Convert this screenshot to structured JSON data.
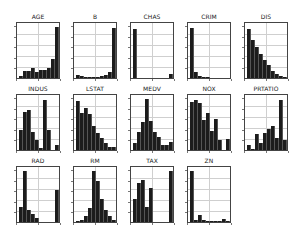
{
  "figure": {
    "title": "",
    "layout": "3 rows x 5 columns of histograms"
  },
  "chart_data": [
    {
      "type": "bar",
      "title": "AGE",
      "bins": 10,
      "values": [
        4,
        14,
        14,
        19,
        12,
        15,
        16,
        18,
        35,
        96
      ],
      "ylim": [
        0,
        100
      ]
    },
    {
      "type": "bar",
      "title": "B",
      "bins": 10,
      "values": [
        5,
        3,
        2,
        1,
        1,
        2,
        3,
        5,
        12,
        95
      ],
      "ylim": [
        0,
        100
      ]
    },
    {
      "type": "bar",
      "title": "CHAS",
      "bins": 10,
      "values": [
        93,
        0,
        0,
        0,
        0,
        0,
        0,
        0,
        0,
        7
      ],
      "ylim": [
        0,
        100
      ]
    },
    {
      "type": "bar",
      "title": "CRIM",
      "bins": 10,
      "values": [
        95,
        12,
        4,
        1,
        1,
        0,
        0,
        0,
        0,
        0
      ],
      "ylim": [
        0,
        100
      ]
    },
    {
      "type": "bar",
      "title": "DIS",
      "bins": 10,
      "values": [
        92,
        72,
        58,
        45,
        34,
        25,
        14,
        8,
        4,
        1
      ],
      "ylim": [
        0,
        100
      ]
    },
    {
      "type": "bar",
      "title": "INDUS",
      "bins": 10,
      "values": [
        38,
        72,
        76,
        34,
        18,
        4,
        95,
        38,
        0,
        10
      ],
      "ylim": [
        0,
        100
      ]
    },
    {
      "type": "bar",
      "title": "LSTAT",
      "bins": 10,
      "values": [
        93,
        70,
        80,
        68,
        46,
        32,
        22,
        14,
        6,
        6
      ],
      "ylim": [
        0,
        100
      ]
    },
    {
      "type": "bar",
      "title": "MEDV",
      "bins": 10,
      "values": [
        14,
        34,
        52,
        96,
        54,
        34,
        24,
        9,
        10,
        16
      ],
      "ylim": [
        0,
        100
      ]
    },
    {
      "type": "bar",
      "title": "NOX",
      "bins": 10,
      "values": [
        90,
        94,
        88,
        57,
        69,
        36,
        58,
        18,
        0,
        20
      ],
      "ylim": [
        0,
        100
      ]
    },
    {
      "type": "bar",
      "title": "PRTATIO",
      "bins": 10,
      "values": [
        10,
        2,
        30,
        14,
        32,
        40,
        45,
        22,
        95,
        18
      ],
      "ylim": [
        0,
        100
      ]
    },
    {
      "type": "bar",
      "title": "RAD",
      "bins": 10,
      "values": [
        28,
        96,
        22,
        15,
        8,
        0,
        0,
        0,
        0,
        60
      ],
      "ylim": [
        0,
        100
      ]
    },
    {
      "type": "bar",
      "title": "RM",
      "bins": 10,
      "values": [
        1,
        3,
        12,
        26,
        96,
        78,
        44,
        22,
        12,
        4
      ],
      "ylim": [
        0,
        100
      ]
    },
    {
      "type": "bar",
      "title": "TAX",
      "bins": 10,
      "values": [
        44,
        74,
        80,
        28,
        64,
        0,
        0,
        0,
        0,
        96
      ],
      "ylim": [
        0,
        100
      ]
    },
    {
      "type": "bar",
      "title": "ZN",
      "bins": 10,
      "values": [
        96,
        4,
        14,
        4,
        2,
        1,
        1,
        1,
        5,
        2
      ],
      "ylim": [
        0,
        100
      ]
    }
  ]
}
